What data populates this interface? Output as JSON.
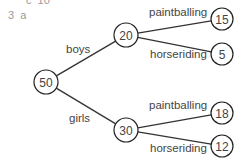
{
  "header": {
    "prev_item": "c  10",
    "question": "3  a"
  },
  "tree": {
    "root": {
      "label": "50",
      "cx": 46,
      "cy": 82,
      "r": 12
    },
    "level1": [
      {
        "edge_label": "boys",
        "node": {
          "label": "20",
          "cx": 126,
          "cy": 35,
          "r": 12
        },
        "label_pos": {
          "x": 66,
          "y": 53
        },
        "children": [
          {
            "edge_label": "paintballing",
            "node": {
              "label": "15",
              "cx": 222,
              "cy": 19,
              "r": 11
            },
            "label_pos": {
              "x": 149,
              "y": 16
            }
          },
          {
            "edge_label": "horseriding",
            "node": {
              "label": "5",
              "cx": 222,
              "cy": 54,
              "r": 11
            },
            "label_pos": {
              "x": 150,
              "y": 58
            }
          }
        ]
      },
      {
        "edge_label": "girls",
        "node": {
          "label": "30",
          "cx": 126,
          "cy": 130,
          "r": 12
        },
        "label_pos": {
          "x": 69,
          "y": 122
        },
        "children": [
          {
            "edge_label": "paintballing",
            "node": {
              "label": "18",
              "cx": 222,
              "cy": 113,
              "r": 11
            },
            "label_pos": {
              "x": 149,
              "y": 109
            }
          },
          {
            "edge_label": "horseriding",
            "node": {
              "label": "12",
              "cx": 222,
              "cy": 146,
              "r": 11
            },
            "label_pos": {
              "x": 150,
              "y": 152
            }
          }
        ]
      }
    ]
  },
  "colors": {
    "line": "#333333",
    "text": "#444444",
    "header_text": "#9a9a9a"
  }
}
